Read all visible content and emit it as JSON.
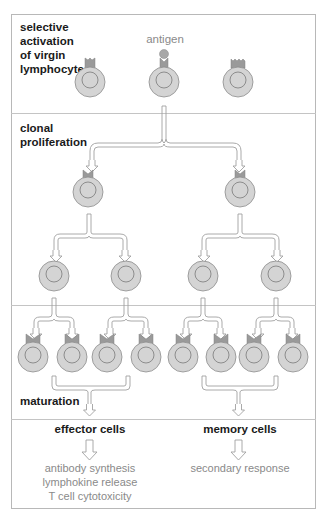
{
  "sections": [
    {
      "id": "selection",
      "label_lines": [
        "selective",
        "activation",
        "of virgin",
        "lymphocyte"
      ]
    },
    {
      "id": "proliferation",
      "label_lines": [
        "clonal",
        "proliferation"
      ]
    },
    {
      "id": "maturation",
      "label_lines": [
        "maturation"
      ]
    }
  ],
  "antigen_label": "antigen",
  "outcomes": {
    "effector": {
      "title": "effector cells",
      "functions": [
        "antibody synthesis",
        "lymphokine release",
        "T cell cytotoxicity"
      ]
    },
    "memory": {
      "title": "memory cells",
      "functions": [
        "secondary response"
      ]
    }
  },
  "colors": {
    "cell_fill": "#d4d4d4",
    "cell_stroke": "#8c8c8c",
    "receptor_fill": "#9a9a9a",
    "antigen_fill": "#a8a8a8",
    "arrow_stroke": "#a0a0a0",
    "frame": "#b8b8b8"
  }
}
